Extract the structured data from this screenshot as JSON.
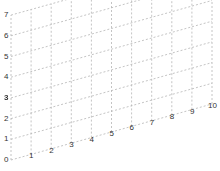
{
  "chart_data": {
    "type": "line",
    "title": "",
    "xlabel": "",
    "ylabel": "",
    "projection": "skewed-3d-grid",
    "x_ticks": [
      "0",
      "1",
      "2",
      "3",
      "4",
      "5",
      "6",
      "7",
      "8",
      "9",
      "10"
    ],
    "y_ticks": [
      "0",
      "1",
      "2",
      "3",
      "4",
      "5",
      "6",
      "7"
    ],
    "xlim": [
      0,
      10
    ],
    "ylim": [
      0,
      7
    ],
    "grid": true,
    "grid_style": "dashed",
    "series": []
  },
  "colors": {
    "grid": "#b5b5b5",
    "text": "#333333",
    "background": "#ffffff"
  }
}
